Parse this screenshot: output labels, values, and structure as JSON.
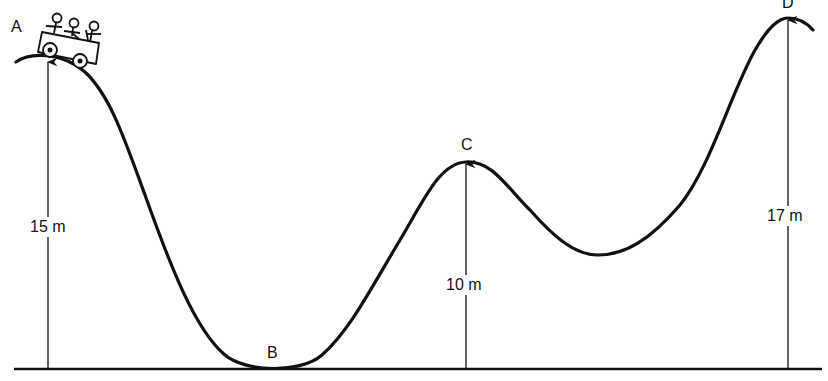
{
  "diagram": {
    "type": "roller-coaster-track-profile",
    "colors": {
      "line": "#111111",
      "background": "#ffffff"
    },
    "points": [
      {
        "label": "A",
        "height_label": "15 m",
        "height_m": 15
      },
      {
        "label": "B",
        "height_label": "",
        "height_m": 0
      },
      {
        "label": "C",
        "height_label": "10 m",
        "height_m": 10
      },
      {
        "label": "D",
        "height_label": "17 m",
        "height_m": 17
      }
    ],
    "vehicle": {
      "icon": "roller-coaster-car-icon",
      "riders": 3,
      "position": "A"
    }
  }
}
